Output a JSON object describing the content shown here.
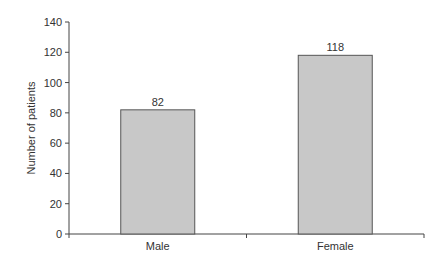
{
  "chart_data": {
    "type": "bar",
    "title": "",
    "xlabel": "",
    "ylabel": "Number of patients",
    "categories": [
      "Male",
      "Female"
    ],
    "values": [
      82,
      118
    ],
    "data_labels": [
      "82",
      "118"
    ],
    "ylim": [
      0,
      140
    ],
    "yticks": [
      0,
      20,
      40,
      60,
      80,
      100,
      120,
      140
    ],
    "grid": false,
    "legend": null,
    "bar_color": "#c8c8c8",
    "bar_edge_color": "#555555"
  }
}
